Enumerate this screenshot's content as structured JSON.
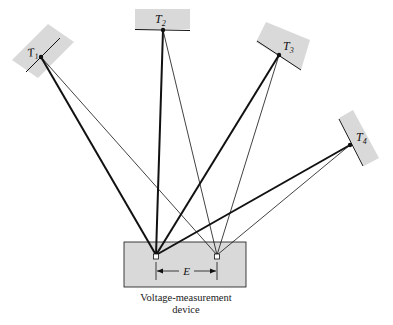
{
  "diagram": {
    "colors": {
      "box_fill": "#d9d9d9",
      "stroke": "#111111",
      "background": "#ffffff"
    },
    "transmitters": [
      {
        "id": "T1",
        "label": "T",
        "subscript": "1"
      },
      {
        "id": "T2",
        "label": "T",
        "subscript": "2"
      },
      {
        "id": "T3",
        "label": "T",
        "subscript": "3"
      },
      {
        "id": "T4",
        "label": "T",
        "subscript": "4"
      }
    ],
    "device": {
      "caption_line1": "Voltage-measurement",
      "caption_line2": "device",
      "spacing_label": "E"
    }
  }
}
